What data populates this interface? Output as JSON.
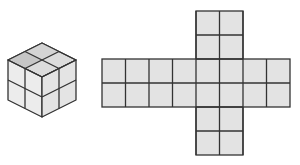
{
  "diagram": {
    "colors": {
      "stroke": "#333333",
      "top_face_light": "#e2e2e2",
      "top_face_dark": "#c9c9c9",
      "left_face": "#ececec",
      "right_face": "#e6e6e6",
      "net_cell": "#e3e3e3"
    },
    "cube": {
      "grid": "2x2x2"
    },
    "net": {
      "shape": "cross",
      "horizontal_band": {
        "columns": 8,
        "rows": 2
      },
      "vertical_band": {
        "columns": 2,
        "rows": 6
      },
      "cell_size_px": 23.5
    }
  }
}
